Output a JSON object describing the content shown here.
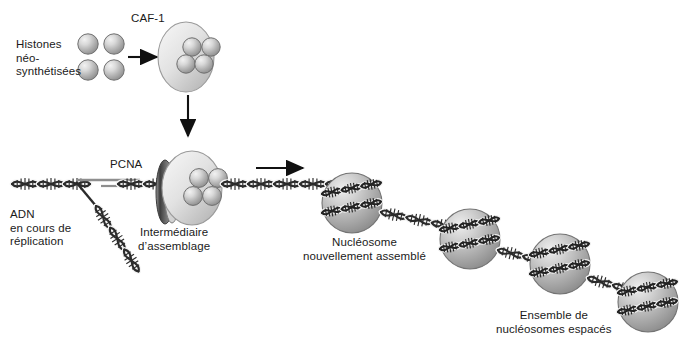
{
  "figure": {
    "type": "biology-diagram",
    "background_color": "#ffffff",
    "text_color": "#1a1a1a"
  },
  "labels": {
    "histones": "Histones\nnéo-\nsynthétisées",
    "caf1": "CAF-1",
    "pcna": "PCNA",
    "dna_replication": "ADN\nen cours de\nréplication",
    "assembly_intermediate": "Intermédiaire\nd’assemblage",
    "new_nucleosome": "Nucléosome\nnouvellement assemblé",
    "spaced_nucleosomes": "Ensemble de\nnucléosomes espacés"
  },
  "palette": {
    "sphere_light": "#e8e8e8",
    "sphere_mid": "#b9b9b9",
    "sphere_dark": "#8a8a8a",
    "sphere_edge": "#6f6f6f",
    "dna_dark": "#2b2b2b",
    "dna_light": "#f2f2f2",
    "pcna_dark": "#4a4a4a",
    "arrow": "#111111"
  },
  "elements": {
    "free_histones": {
      "count": 4,
      "radius": 10,
      "centers": [
        [
          88,
          44
        ],
        [
          114,
          44
        ],
        [
          88,
          70
        ],
        [
          114,
          70
        ]
      ]
    },
    "caf1_complex": {
      "center": [
        186,
        57
      ],
      "rx": 28,
      "ry": 35,
      "bound_histones": 4
    },
    "assembly_complex": {
      "center": [
        190,
        188
      ],
      "rx": 30,
      "ry": 37,
      "bound_histones": 4,
      "pcna_ring_x": 163
    },
    "nucleosomes": [
      {
        "cx": 352,
        "cy": 203,
        "r": 30
      },
      {
        "cx": 470,
        "cy": 239,
        "r": 30
      },
      {
        "cx": 560,
        "cy": 264,
        "r": 30
      },
      {
        "cx": 648,
        "cy": 302,
        "r": 30
      }
    ],
    "arrows": [
      {
        "name": "histones-to-caf1",
        "x1": 128,
        "y1": 57,
        "x2": 158,
        "y2": 57,
        "direction": "right"
      },
      {
        "name": "caf1-to-intermediate",
        "x1": 188,
        "y1": 95,
        "x2": 188,
        "y2": 137,
        "direction": "down"
      },
      {
        "name": "intermediate-to-nucleosome",
        "x1": 256,
        "y1": 168,
        "x2": 304,
        "y2": 168,
        "direction": "right"
      }
    ],
    "dna": {
      "parental_y": 184,
      "leading_strand": "horizontal double helix",
      "lagging_strand": "diagonal branch descending right from fork at x=75"
    }
  },
  "label_positions": {
    "histones": [
      16,
      38
    ],
    "caf1": [
      131,
      12
    ],
    "pcna": [
      110,
      158
    ],
    "dna_replication": [
      10,
      208
    ],
    "assembly_intermediate": [
      138,
      226
    ],
    "new_nucleosome": [
      303,
      236
    ],
    "spaced_nucleosomes": [
      496,
      309
    ]
  }
}
